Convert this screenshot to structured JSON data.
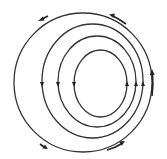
{
  "diagram": {
    "type": "nested-offset-streamlines",
    "stroke_color": "#333333",
    "background": "#ffffff",
    "streamlines": [
      {
        "id": "outer",
        "cx": 83,
        "cy": 82.5,
        "rx": 69,
        "ry": 69.5
      },
      {
        "id": "ring-2",
        "cx": 92.5,
        "cy": 81,
        "rx": 50.5,
        "ry": 57
      },
      {
        "id": "ring-3",
        "cx": 97,
        "cy": 81.5,
        "rx": 39,
        "ry": 45.5
      },
      {
        "id": "inner",
        "cx": 100.5,
        "cy": 83.5,
        "rx": 26.5,
        "ry": 33.5
      }
    ],
    "centerline_arrow_direction": {
      "left": "down",
      "right": "up"
    },
    "flow_direction": "counterclockwise",
    "outer_arrows": [
      "top-left",
      "top-right",
      "right",
      "bottom-left",
      "bottom-right"
    ]
  }
}
